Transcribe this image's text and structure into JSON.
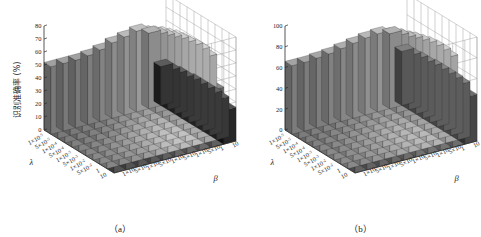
{
  "figure": {
    "background": "#ffffff",
    "panels": [
      {
        "caption": "（a）",
        "id": "panel-a"
      },
      {
        "caption": "（b）",
        "id": "panel-b"
      }
    ]
  },
  "chart_data": [
    {
      "type": "bar",
      "subtype": "bar3d",
      "title": "",
      "caption": "（a）",
      "xlabel": "λ",
      "zlabel": "β",
      "ylabel": "识别准确率 (%)",
      "ylim": [
        0,
        80
      ],
      "yticks": [
        0,
        10,
        20,
        30,
        40,
        50,
        60,
        70,
        80
      ],
      "ytick_labels": [
        "0",
        "10",
        "20",
        "30",
        "40",
        "50",
        "60",
        "70",
        "80"
      ],
      "grid": true,
      "legend": "none",
      "colormap": "gray",
      "x_categories": [
        "1×10⁻⁵",
        "5×10⁻⁵",
        "1×10⁻⁴",
        "5×10⁻⁴",
        "1×10⁻³",
        "5×10⁻³",
        "1×10⁻²",
        "5×10⁻²",
        "1",
        "10"
      ],
      "z_categories": [
        "1×10⁻⁵",
        "5×10⁻⁵",
        "1×10⁻⁴",
        "5×10⁻⁴",
        "1×10⁻³",
        "5×10⁻³",
        "1×10⁻²",
        "5×10⁻²",
        "1",
        "10"
      ],
      "values": [
        [
          52,
          52,
          52,
          53,
          55,
          58,
          60,
          62,
          58,
          30
        ],
        [
          52,
          52,
          53,
          54,
          57,
          60,
          63,
          64,
          60,
          30
        ],
        [
          53,
          53,
          54,
          56,
          59,
          63,
          66,
          67,
          62,
          31
        ],
        [
          54,
          54,
          56,
          58,
          62,
          66,
          69,
          70,
          64,
          31
        ],
        [
          55,
          56,
          58,
          61,
          65,
          69,
          72,
          72,
          66,
          32
        ],
        [
          56,
          57,
          60,
          63,
          67,
          71,
          74,
          74,
          67,
          32
        ],
        [
          57,
          58,
          61,
          64,
          68,
          72,
          75,
          75,
          68,
          32
        ],
        [
          57,
          58,
          61,
          64,
          69,
          73,
          75,
          75,
          68,
          32
        ],
        [
          56,
          57,
          60,
          63,
          67,
          71,
          73,
          73,
          66,
          31
        ],
        [
          40,
          40,
          41,
          42,
          44,
          46,
          47,
          47,
          44,
          26
        ]
      ]
    },
    {
      "type": "bar",
      "subtype": "bar3d",
      "title": "",
      "caption": "（b）",
      "xlabel": "λ",
      "zlabel": "β",
      "ylabel": "识别准确率 (%)",
      "ylim": [
        0,
        100
      ],
      "yticks": [
        0,
        20,
        40,
        60,
        80,
        100
      ],
      "ytick_labels": [
        "0",
        "20",
        "40",
        "60",
        "80",
        "100"
      ],
      "grid": true,
      "legend": "none",
      "colormap": "gray",
      "x_categories": [
        "1×10⁻⁵",
        "5×10⁻⁵",
        "1×10⁻⁴",
        "5×10⁻⁴",
        "1×10⁻³",
        "5×10⁻³",
        "1×10⁻²",
        "5×10⁻²",
        "1",
        "10"
      ],
      "z_categories": [
        "1×10⁻⁵",
        "5×10⁻⁵",
        "1×10⁻⁴",
        "5×10⁻⁴",
        "1×10⁻³",
        "5×10⁻³",
        "1×10⁻²",
        "5×10⁻²",
        "1",
        "10"
      ],
      "values": [
        [
          66,
          66,
          67,
          68,
          70,
          72,
          74,
          75,
          72,
          52
        ],
        [
          66,
          67,
          68,
          70,
          72,
          75,
          77,
          78,
          74,
          52
        ],
        [
          67,
          68,
          70,
          72,
          75,
          78,
          80,
          81,
          76,
          53
        ],
        [
          68,
          70,
          72,
          75,
          78,
          81,
          84,
          84,
          79,
          53
        ],
        [
          70,
          71,
          74,
          77,
          81,
          85,
          87,
          87,
          81,
          54
        ],
        [
          71,
          72,
          76,
          79,
          83,
          87,
          89,
          89,
          83,
          54
        ],
        [
          72,
          73,
          77,
          80,
          84,
          88,
          90,
          90,
          84,
          54
        ],
        [
          72,
          73,
          77,
          80,
          84,
          88,
          90,
          90,
          84,
          54
        ],
        [
          71,
          72,
          76,
          79,
          83,
          86,
          88,
          88,
          82,
          53
        ],
        [
          56,
          56,
          57,
          58,
          60,
          62,
          63,
          63,
          60,
          45
        ]
      ]
    }
  ],
  "axis_labels": {
    "lambda": "λ",
    "beta": "β",
    "percent_axis": "识别准确率 (%)",
    "mantissas": [
      "1",
      "5",
      "1",
      "5",
      "1",
      "5",
      "1",
      "5",
      "1",
      "10"
    ],
    "exponents": [
      "-5",
      "-5",
      "-4",
      "-4",
      "-3",
      "-3",
      "-2",
      "-2",
      "",
      ""
    ]
  },
  "colors": {
    "background": "#ffffff",
    "axis": "#2b2b2b",
    "grid": "#9b9b9b",
    "text": "#1b1b1b",
    "bar_dark": "#2e2e2e",
    "bar_light": "#d8d8d8"
  }
}
